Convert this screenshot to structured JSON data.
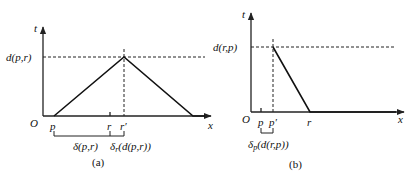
{
  "figure_a": {
    "caption": "(a)",
    "y_axis_label": "t",
    "x_axis_label": "x",
    "origin_label": "O",
    "level_label": "d(p,r)",
    "ticks": {
      "p": "p",
      "r": "r",
      "r_prime": "r′"
    },
    "brackets": {
      "left": "δ(p,r)",
      "right_base": "δ",
      "right_sub": "r",
      "right_arg": "(d(p,r))"
    }
  },
  "figure_b": {
    "caption": "(b)",
    "y_axis_label": "t",
    "x_axis_label": "x",
    "origin_label": "O",
    "level_label": "d(r,p)",
    "ticks": {
      "p": "p",
      "p_prime": "p′",
      "r": "r"
    },
    "brackets": {
      "base": "δ",
      "sub": "p",
      "arg": "(d(r,p))"
    }
  }
}
